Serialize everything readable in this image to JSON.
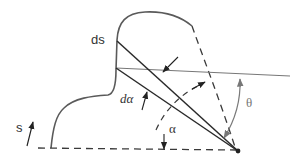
{
  "diagram": {
    "title": "",
    "labels": {
      "ds": "ds",
      "s": "s",
      "d_alpha": "dα",
      "alpha": "α",
      "theta": "θ"
    },
    "colors": {
      "outline": "#5a5a5a",
      "ray": "#2a2a2a",
      "horizon": "#777777",
      "dash": "#3a3a3a",
      "theta": "#7a7a7a",
      "text": "#333333"
    },
    "elements": [
      "boundary-curve",
      "baseline-dashed",
      "observer-point",
      "horizontal-reference-line",
      "ray-upper",
      "ray-lower",
      "arc-dashed-alpha",
      "arc-theta"
    ]
  }
}
